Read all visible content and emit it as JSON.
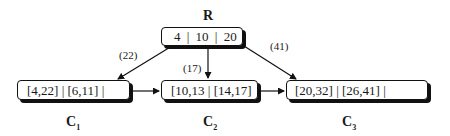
{
  "root": {
    "title": "R",
    "content": "4 | 10 | 20"
  },
  "children": [
    {
      "name": "C",
      "index": "1",
      "content": "[4,22] | [6,11] |",
      "edge_label": "(22)"
    },
    {
      "name": "C",
      "index": "2",
      "content": "[10,13 | [14,17]",
      "edge_label": "(17)"
    },
    {
      "name": "C",
      "index": "3",
      "content": "[20,32] | [26,41] |",
      "edge_label": "(41)"
    }
  ],
  "colors": {
    "stroke": "#111111",
    "background": "#ffffff"
  }
}
